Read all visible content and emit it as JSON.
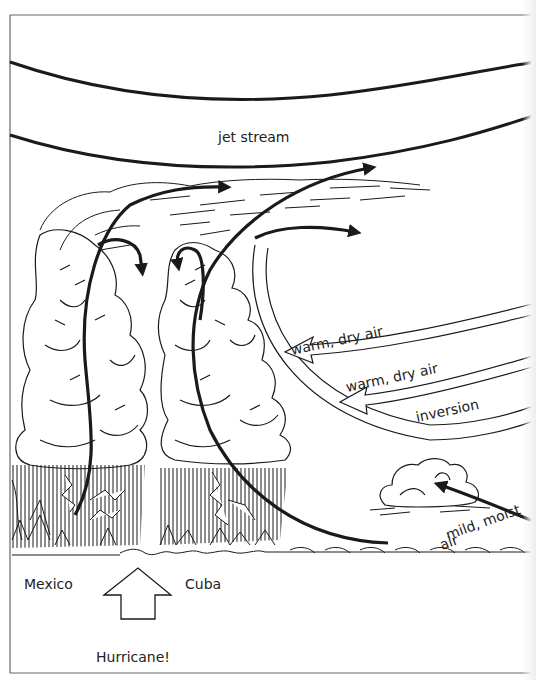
{
  "diagram": {
    "labels": {
      "jet_stream": "jet stream",
      "warm_dry_air_1": "warm, dry air",
      "warm_dry_air_2": "warm, dry air",
      "inversion": "inversion",
      "mild_moist_air_line1": "mild, moist",
      "mild_moist_air_line2": "air",
      "mexico": "Mexico",
      "cuba": "Cuba",
      "hurricane": "Hurricane!"
    },
    "colors": {
      "ink": "#1a1a1a",
      "background": "#ffffff",
      "frame": "#555555"
    },
    "elements": [
      "jet-stream-band",
      "thunderstorm-cloud-left",
      "thunderstorm-cloud-middle",
      "small-cumulus-cloud",
      "updraft-arrows",
      "warm-dry-air-arrows",
      "inversion-layer",
      "ocean-waves",
      "hurricane-up-arrow"
    ]
  }
}
